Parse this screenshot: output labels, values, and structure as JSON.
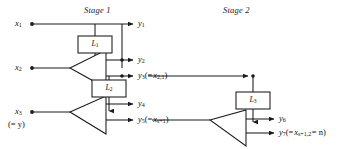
{
  "figure": {
    "type": "signal-flow-diagram",
    "background_color": "#ffffff",
    "line_color": "#1a1a1a",
    "stages": [
      {
        "id": "stage-1",
        "label": "Stage 1",
        "x": 84,
        "y": 6
      },
      {
        "id": "stage-2",
        "label": "Stage 2",
        "x": 223,
        "y": 6
      }
    ],
    "inputs": [
      {
        "id": "x1",
        "base": "x",
        "sub": "1",
        "x": 18,
        "y": 20
      },
      {
        "id": "x2",
        "base": "x",
        "sub": "2",
        "x": 18,
        "y": 64
      },
      {
        "id": "x3",
        "base": "x",
        "sub": "3",
        "x": 18,
        "y": 108
      }
    ],
    "input_notes": [
      {
        "id": "x3-alias",
        "text": "(= y)",
        "x": 12,
        "y": 121
      }
    ],
    "outputs": [
      {
        "id": "y1",
        "base": "y",
        "sub": "1",
        "note": "",
        "x": 140,
        "y": 20
      },
      {
        "id": "y2",
        "base": "y",
        "sub": "2",
        "note": "",
        "x": 140,
        "y": 56
      },
      {
        "id": "y3",
        "base": "y",
        "sub": "3",
        "note": "(= x2,1)",
        "note_var": "x",
        "note_sub": "2,1",
        "x": 140,
        "y": 72
      },
      {
        "id": "y4",
        "base": "y",
        "sub": "4",
        "note": "",
        "x": 140,
        "y": 100
      },
      {
        "id": "y5",
        "base": "y",
        "sub": "5",
        "note": "(= xs+1)",
        "note_var": "x",
        "note_sub": "s+1",
        "x": 140,
        "y": 116
      },
      {
        "id": "y6",
        "base": "y",
        "sub": "6",
        "note": "",
        "x": 281,
        "y": 115
      },
      {
        "id": "y7",
        "base": "y",
        "sub": "7",
        "note": "(= xs+1,2 = n)",
        "note_var": "x",
        "note_sub": "s+1,2",
        "note_tail": "= n)",
        "x": 281,
        "y": 130
      }
    ],
    "blocks": [
      {
        "id": "L1",
        "base": "L",
        "sub": "1",
        "x": 78,
        "y": 36,
        "w": 34,
        "h": 17
      },
      {
        "id": "L2",
        "base": "L",
        "sub": "2",
        "x": 92,
        "y": 80,
        "w": 34,
        "h": 17
      },
      {
        "id": "L3",
        "base": "L",
        "sub": "3",
        "x": 236,
        "y": 92,
        "w": 34,
        "h": 17
      }
    ],
    "amplifiers": [
      {
        "id": "amp-1",
        "stage": "stage-1",
        "apex_x": 70,
        "top_y": 50,
        "bottom_y": 88,
        "tip_x": 106
      },
      {
        "id": "amp-2",
        "stage": "stage-1",
        "apex_x": 70,
        "top_y": 96,
        "bottom_y": 134,
        "tip_x": 106
      },
      {
        "id": "amp-3",
        "stage": "stage-2",
        "apex_x": 210,
        "top_y": 110,
        "bottom_y": 146,
        "tip_x": 246
      }
    ]
  }
}
